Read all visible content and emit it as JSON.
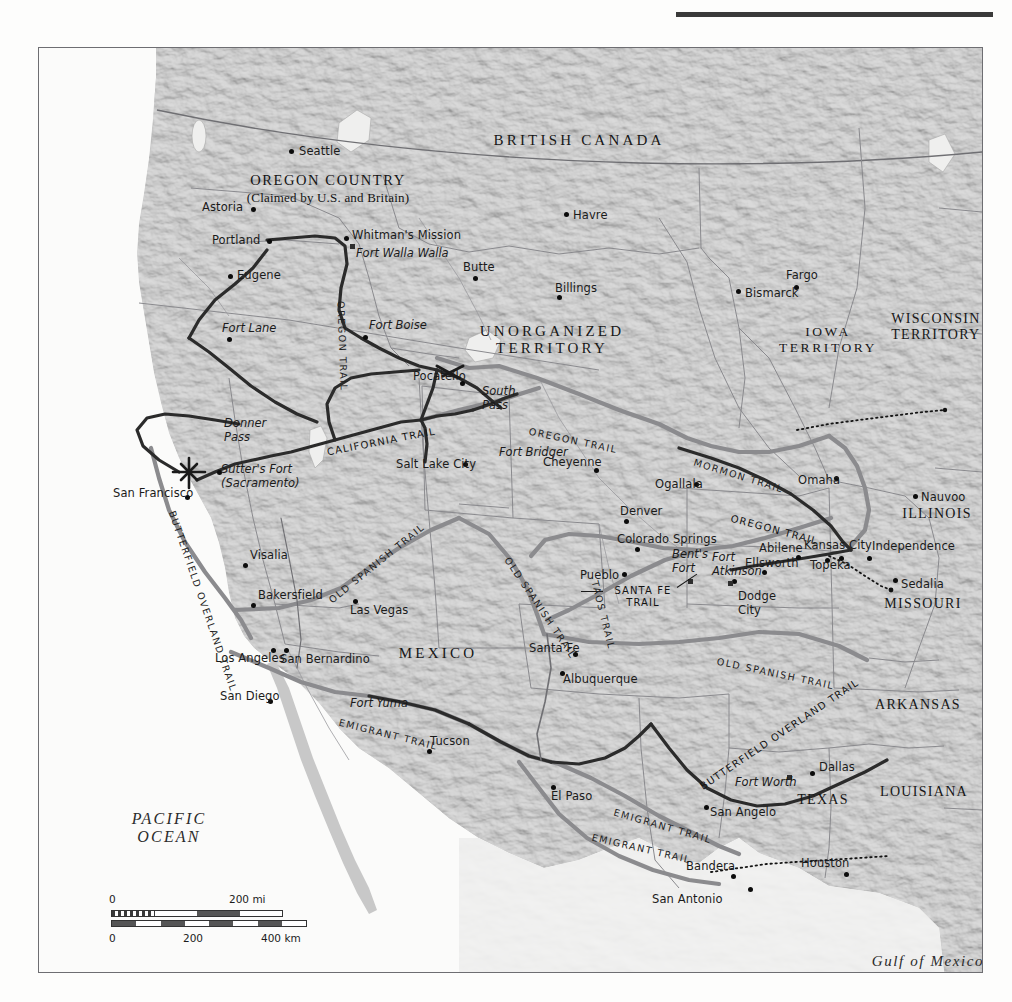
{
  "map": {
    "title_visible": false,
    "frame": {
      "x": 38,
      "y": 47,
      "w": 943,
      "h": 924
    },
    "colors": {
      "land": "#c6c6c6",
      "water": "#f7f7f5",
      "trail_dark": "#2a2a2a",
      "trail_gray": "#7d7d80",
      "border": "#6e6e72",
      "text": "#1a1a1a"
    },
    "regions": [
      {
        "name": "BRITISH CANADA",
        "x": 540,
        "y": 92,
        "style": "region"
      },
      {
        "name": "UNORGANIZED\nTERRITORY",
        "x": 513,
        "y": 292,
        "style": "region"
      },
      {
        "name": "IOWA\nTERRITORY",
        "x": 789,
        "y": 292,
        "style": "region-small"
      },
      {
        "name": "WISCONSIN\nTERRITORY",
        "x": 897,
        "y": 279,
        "style": "state"
      },
      {
        "name": "MEXICO",
        "x": 399,
        "y": 605,
        "style": "region"
      },
      {
        "name": "TEXAS",
        "x": 784,
        "y": 752,
        "style": "state"
      },
      {
        "name": "ILLINOIS",
        "x": 898,
        "y": 466,
        "style": "state"
      },
      {
        "name": "MISSOURI",
        "x": 884,
        "y": 556,
        "style": "state"
      },
      {
        "name": "ARKANSAS",
        "x": 879,
        "y": 657,
        "style": "state"
      },
      {
        "name": "LOUISIANA",
        "x": 885,
        "y": 744,
        "style": "state"
      }
    ],
    "oregon_country": {
      "line1": "OREGON COUNTRY",
      "line2": "(Claimed by U.S. and Britain)",
      "x": 289,
      "y": 141
    },
    "water_labels": [
      {
        "name": "PACIFIC\nOCEAN",
        "x": 130,
        "y": 780
      },
      {
        "name": "Gulf of Mexico",
        "x": 889,
        "y": 913
      }
    ],
    "cities": [
      {
        "name": "Seattle",
        "lx": 260,
        "ly": 103,
        "dx": 250,
        "dy": 101,
        "anchor": "left",
        "type": "city"
      },
      {
        "name": "Astoria",
        "lx": 163,
        "ly": 159,
        "dx": 212,
        "dy": 159,
        "anchor": "left",
        "type": "city"
      },
      {
        "name": "Portland",
        "lx": 173,
        "ly": 192,
        "dx": 228,
        "dy": 191,
        "anchor": "left",
        "type": "city"
      },
      {
        "name": "Eugene",
        "lx": 198,
        "ly": 227,
        "dx": 189,
        "dy": 226,
        "anchor": "left",
        "type": "city"
      },
      {
        "name": "Havre",
        "lx": 534,
        "ly": 167,
        "dx": 525,
        "dy": 164,
        "anchor": "left",
        "type": "city"
      },
      {
        "name": "Butte",
        "lx": 424,
        "ly": 219,
        "dx": 434,
        "dy": 228,
        "anchor": "left",
        "type": "city"
      },
      {
        "name": "Billings",
        "lx": 516,
        "ly": 240,
        "dx": 518,
        "dy": 247,
        "anchor": "left",
        "type": "city"
      },
      {
        "name": "Fargo",
        "lx": 747,
        "ly": 227,
        "dx": 755,
        "dy": 237,
        "anchor": "left",
        "type": "city"
      },
      {
        "name": "Bismarck",
        "lx": 706,
        "ly": 245,
        "dx": 697,
        "dy": 241,
        "anchor": "left",
        "type": "city"
      },
      {
        "name": "Pocatello",
        "lx": 374,
        "ly": 328,
        "dx": 421,
        "dy": 333,
        "anchor": "left",
        "type": "city"
      },
      {
        "name": "Salt Lake City",
        "lx": 357,
        "ly": 416,
        "dx": 424,
        "dy": 414,
        "anchor": "left",
        "type": "city"
      },
      {
        "name": "Cheyenne",
        "lx": 504,
        "ly": 414,
        "dx": 555,
        "dy": 420,
        "anchor": "left",
        "type": "city"
      },
      {
        "name": "Ogallala",
        "lx": 616,
        "ly": 436,
        "dx": 655,
        "dy": 434,
        "anchor": "left",
        "type": "city"
      },
      {
        "name": "Omaha",
        "lx": 759,
        "ly": 432,
        "dx": 795,
        "dy": 428,
        "anchor": "left",
        "type": "city"
      },
      {
        "name": "Nauvoo",
        "lx": 882,
        "ly": 449,
        "dx": 874,
        "dy": 446,
        "anchor": "left",
        "type": "city"
      },
      {
        "name": "Denver",
        "lx": 581,
        "ly": 463,
        "dx": 585,
        "dy": 471,
        "anchor": "left",
        "type": "city"
      },
      {
        "name": "Colorado Springs",
        "lx": 578,
        "ly": 491,
        "dx": 596,
        "dy": 499,
        "anchor": "left",
        "type": "city"
      },
      {
        "name": "Abilene",
        "lx": 720,
        "ly": 500,
        "dx": 757,
        "dy": 507,
        "anchor": "left",
        "type": "city"
      },
      {
        "name": "Kansas City",
        "lx": 765,
        "ly": 497,
        "dx": 800,
        "dy": 508,
        "anchor": "left",
        "type": "city"
      },
      {
        "name": "Independence",
        "lx": 833,
        "ly": 498,
        "dx": 828,
        "dy": 508,
        "anchor": "left",
        "type": "city"
      },
      {
        "name": "Ellsworth",
        "lx": 706,
        "ly": 515,
        "dx": 723,
        "dy": 522,
        "anchor": "left",
        "type": "city"
      },
      {
        "name": "Topeka",
        "lx": 771,
        "ly": 517,
        "dx": 786,
        "dy": 510,
        "anchor": "left",
        "type": "city"
      },
      {
        "name": "Pueblo",
        "lx": 541,
        "ly": 527,
        "dx": 583,
        "dy": 524,
        "anchor": "left",
        "type": "city"
      },
      {
        "name": "Sedalia",
        "lx": 862,
        "ly": 536,
        "dx": 854,
        "dy": 530,
        "anchor": "left",
        "type": "city"
      },
      {
        "name": "Dodge\nCity",
        "lx": 699,
        "ly": 555,
        "dx": 693,
        "dy": 531,
        "anchor": "left",
        "type": "city"
      },
      {
        "name": "Visalia",
        "lx": 211,
        "ly": 507,
        "dx": 204,
        "dy": 515,
        "anchor": "left",
        "type": "city"
      },
      {
        "name": "Bakersfield",
        "lx": 219,
        "ly": 547,
        "dx": 212,
        "dy": 555,
        "anchor": "left",
        "type": "city"
      },
      {
        "name": "Las Vegas",
        "lx": 311,
        "ly": 562,
        "dx": 314,
        "dy": 551,
        "anchor": "left",
        "type": "city"
      },
      {
        "name": "San Francisco",
        "lx": 74,
        "ly": 445,
        "dx": 146,
        "dy": 447,
        "anchor": "left",
        "type": "city"
      },
      {
        "name": "Los Angeles",
        "lx": 176,
        "ly": 610,
        "dx": 232,
        "dy": 600,
        "anchor": "left",
        "type": "city"
      },
      {
        "name": "San Bernardino",
        "lx": 241,
        "ly": 611,
        "dx": 245,
        "dy": 600,
        "anchor": "left",
        "type": "city"
      },
      {
        "name": "San Diego",
        "lx": 181,
        "ly": 648,
        "dx": 229,
        "dy": 651,
        "anchor": "left",
        "type": "city"
      },
      {
        "name": "Santa Fe",
        "lx": 490,
        "ly": 600,
        "dx": 534,
        "dy": 604,
        "anchor": "left",
        "type": "city"
      },
      {
        "name": "Albuquerque",
        "lx": 524,
        "ly": 631,
        "dx": 521,
        "dy": 623,
        "anchor": "left",
        "type": "city"
      },
      {
        "name": "Tucson",
        "lx": 391,
        "ly": 693,
        "dx": 388,
        "dy": 701,
        "anchor": "left",
        "type": "city"
      },
      {
        "name": "El Paso",
        "lx": 512,
        "ly": 748,
        "dx": 512,
        "dy": 737,
        "anchor": "left",
        "type": "city"
      },
      {
        "name": "San Angelo",
        "lx": 671,
        "ly": 764,
        "dx": 665,
        "dy": 757,
        "anchor": "left",
        "type": "city"
      },
      {
        "name": "Dallas",
        "lx": 780,
        "ly": 719,
        "dx": 771,
        "dy": 723,
        "anchor": "left",
        "type": "city"
      },
      {
        "name": "Houston",
        "lx": 762,
        "ly": 815,
        "dx": 805,
        "dy": 824,
        "anchor": "left",
        "type": "city"
      },
      {
        "name": "Bandera",
        "lx": 647,
        "ly": 818,
        "dx": 692,
        "dy": 826,
        "anchor": "left",
        "type": "city"
      },
      {
        "name": "San Antonio",
        "lx": 613,
        "ly": 851,
        "dx": 709,
        "dy": 839,
        "anchor": "left",
        "type": "city"
      }
    ],
    "forts": [
      {
        "name": "Whitman's Mission",
        "lx": 313,
        "ly": 187,
        "dx": 305,
        "dy": 188,
        "type": "city"
      },
      {
        "name": "Fort Walla Walla",
        "lx": 317,
        "ly": 205,
        "dx": 311,
        "dy": 196,
        "type": "fort"
      },
      {
        "name": "Fort Lane",
        "lx": 183,
        "ly": 280,
        "dx": 188,
        "dy": 289,
        "type": "fort"
      },
      {
        "name": "Fort Boise",
        "lx": 330,
        "ly": 277,
        "dx": 324,
        "dy": 287,
        "type": "fort"
      },
      {
        "name": "South\nPass",
        "lx": 443,
        "ly": 350,
        "dx": null,
        "dy": null,
        "type": "fort"
      },
      {
        "name": "Fort Bridger",
        "lx": 460,
        "ly": 404,
        "dx": null,
        "dy": null,
        "type": "fort"
      },
      {
        "name": "Donner\nPass",
        "lx": 185,
        "ly": 382,
        "dx": null,
        "dy": null,
        "type": "fort"
      },
      {
        "name": "Sutter's Fort\n(Sacramento)",
        "lx": 182,
        "ly": 428,
        "dx": 178,
        "dy": 422,
        "type": "fort"
      },
      {
        "name": "Bent's\nFort",
        "lx": 633,
        "ly": 513,
        "dx": 649,
        "dy": 531,
        "type": "fort"
      },
      {
        "name": "Fort\nAtkinson",
        "lx": 673,
        "ly": 516,
        "dx": 689,
        "dy": 533,
        "type": "fort"
      },
      {
        "name": "Fort Yuma",
        "lx": 311,
        "ly": 655,
        "dx": null,
        "dy": null,
        "type": "fort"
      },
      {
        "name": "Fort Worth",
        "lx": 696,
        "ly": 734,
        "dx": 748,
        "dy": 727,
        "type": "fort"
      }
    ],
    "trail_labels": [
      {
        "name": "OREGON TRAIL",
        "x": 302,
        "y": 253,
        "rot": 88,
        "style": "gray"
      },
      {
        "name": "OREGON TRAIL",
        "x": 490,
        "y": 383,
        "rot": 12,
        "style": "gray"
      },
      {
        "name": "MORMON TRAIL",
        "x": 655,
        "y": 414,
        "rot": 17,
        "style": "gray"
      },
      {
        "name": "OREGON TRAIL",
        "x": 692,
        "y": 470,
        "rot": 15,
        "style": "dark"
      },
      {
        "name": "CALIFORNIA TRAIL",
        "x": 288,
        "y": 404,
        "rot": -11,
        "style": "dark"
      },
      {
        "name": "BUTTERFIELD OVERLAND TRAIL",
        "x": 133,
        "y": 463,
        "rot": 71,
        "style": "gray"
      },
      {
        "name": "OLD SPANISH TRAIL",
        "x": 291,
        "y": 553,
        "rot": -39,
        "style": "gray"
      },
      {
        "name": "OLD SPANISH TRAIL",
        "x": 468,
        "y": 510,
        "rot": 56,
        "style": "gray"
      },
      {
        "name": "OLD SPANISH TRAIL",
        "x": 678,
        "y": 613,
        "rot": 12,
        "style": "gray"
      },
      {
        "name": "TAOS TRAIL",
        "x": 556,
        "y": 533,
        "rot": 76,
        "style": "gray"
      },
      {
        "name": "SANTA FE\nTRAIL",
        "x": 604,
        "y": 549,
        "rot": 0,
        "style": "callout"
      },
      {
        "name": "EMIGRANT TRAIL",
        "x": 300,
        "y": 674,
        "rot": 14,
        "style": "gray"
      },
      {
        "name": "EMIGRANT TRAIL",
        "x": 575,
        "y": 764,
        "rot": 16,
        "style": "gray"
      },
      {
        "name": "EMIGRANT TRAIL",
        "x": 553,
        "y": 789,
        "rot": 13,
        "style": "gray"
      },
      {
        "name": "BUTTERFIELD OVERLAND TRAIL",
        "x": 662,
        "y": 739,
        "rot": -34,
        "style": "dark"
      }
    ],
    "scale": {
      "mi_labels": [
        "0",
        "200 mi"
      ],
      "km_labels": [
        "0",
        "200",
        "400 km"
      ]
    }
  }
}
